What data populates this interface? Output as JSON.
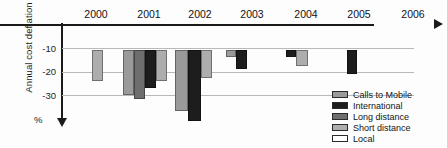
{
  "chart_data": {
    "type": "bar",
    "title": "",
    "xlabel": "",
    "ylabel": "Annual cost deflation",
    "unit_label": "%",
    "ylim": [
      -35,
      0
    ],
    "yticks": [
      -10,
      -20,
      -30
    ],
    "ytick_labels": [
      "-10",
      "-20",
      "-30"
    ],
    "grid": true,
    "legend_position": "bottom-right",
    "categories": [
      "2000",
      "2001",
      "2002",
      "2003",
      "2004",
      "2005",
      "2006"
    ],
    "series": [
      {
        "name": "Calls to Mobile",
        "color": "#9a9a9a",
        "values": [
          null,
          -19,
          -26,
          -3,
          null,
          null,
          null
        ]
      },
      {
        "name": "International",
        "color": "#1d1d1d",
        "values": [
          null,
          -16,
          -30,
          -8,
          -3,
          -10,
          null
        ]
      },
      {
        "name": "Long distance",
        "color": "#6e6e6e",
        "values": [
          null,
          -21,
          null,
          null,
          null,
          null,
          null
        ]
      },
      {
        "name": "Short distance",
        "color": "#adadad",
        "values": [
          -13,
          -13,
          -12,
          null,
          -7,
          null,
          null
        ]
      },
      {
        "name": "Local",
        "color": "#ffffff",
        "values": [
          null,
          null,
          null,
          null,
          null,
          null,
          null
        ]
      }
    ]
  },
  "legend": {
    "items": [
      {
        "label": "Calls to Mobile",
        "color": "#9a9a9a"
      },
      {
        "label": "International",
        "color": "#1d1d1d"
      },
      {
        "label": "Long distance",
        "color": "#6e6e6e"
      },
      {
        "label": "Short distance",
        "color": "#adadad"
      },
      {
        "label": "Local",
        "color": "#ffffff"
      }
    ]
  },
  "bars": [
    {
      "name": "bar-2000-short-distance",
      "left": 30,
      "width": 11,
      "depth": -13,
      "color": "#adadad"
    },
    {
      "name": "bar-2001-calls-to-mobile",
      "left": 61,
      "width": 11,
      "depth": -19,
      "color": "#9a9a9a"
    },
    {
      "name": "bar-2001-long-distance",
      "left": 72,
      "width": 11,
      "depth": -21,
      "color": "#6e6e6e"
    },
    {
      "name": "bar-2001-international",
      "left": 83,
      "width": 11,
      "depth": -16,
      "color": "#1d1d1d"
    },
    {
      "name": "bar-2001-short-distance",
      "left": 94,
      "width": 11,
      "depth": -13,
      "color": "#adadad"
    },
    {
      "name": "bar-2002-calls-to-mobile",
      "left": 113,
      "width": 13,
      "depth": -26,
      "color": "#9a9a9a"
    },
    {
      "name": "bar-2002-international",
      "left": 126,
      "width": 13,
      "depth": -30,
      "color": "#1d1d1d"
    },
    {
      "name": "bar-2002-short-distance",
      "left": 139,
      "width": 11,
      "depth": -12,
      "color": "#adadad"
    },
    {
      "name": "bar-2003-calls-to-mobile",
      "left": 164,
      "width": 10,
      "depth": -3,
      "color": "#9a9a9a"
    },
    {
      "name": "bar-2003-international",
      "left": 174,
      "width": 11,
      "depth": -8,
      "color": "#1d1d1d"
    },
    {
      "name": "bar-2004-international",
      "left": 224,
      "width": 10,
      "depth": -3,
      "color": "#1d1d1d"
    },
    {
      "name": "bar-2004-short-distance",
      "left": 234,
      "width": 12,
      "depth": -7,
      "color": "#adadad"
    },
    {
      "name": "bar-2005-international",
      "left": 285,
      "width": 10,
      "depth": -10,
      "color": "#1d1d1d"
    }
  ],
  "axis": {
    "xticks": [
      {
        "label": "2000",
        "left": 12
      },
      {
        "label": "2001",
        "left": 65
      },
      {
        "label": "2002",
        "left": 116
      },
      {
        "label": "2003",
        "left": 168
      },
      {
        "label": "2004",
        "left": 222
      },
      {
        "label": "2005",
        "left": 275
      },
      {
        "label": "2006",
        "left": 329
      }
    ],
    "ytick_positions": [
      {
        "label": "-10",
        "top": 43
      },
      {
        "label": "-20",
        "top": 66
      },
      {
        "label": "-30",
        "top": 90
      }
    ],
    "gridline_tops": [
      23,
      47,
      70
    ]
  }
}
